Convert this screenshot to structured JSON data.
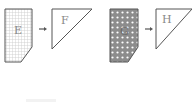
{
  "diagram": {
    "pairs": [
      {
        "source": {
          "label": "E",
          "shape": "pentagon-cut-corner",
          "fill": "grid-pattern"
        },
        "arrow": "right-arrow",
        "target": {
          "label": "F",
          "shape": "right-triangle",
          "fill": "white"
        }
      },
      {
        "source": {
          "label": "G",
          "shape": "pentagon-cut-corner",
          "fill": "dotted-pattern"
        },
        "arrow": "right-arrow",
        "target": {
          "label": "H",
          "shape": "right-triangle",
          "fill": "white"
        }
      }
    ]
  },
  "colors": {
    "stroke": "#555555",
    "grid_line": "#c8c8c8",
    "dot_bg": "#8c8c8c",
    "dot": "#ffffff",
    "label": "#888888",
    "arrow": "#555555"
  }
}
